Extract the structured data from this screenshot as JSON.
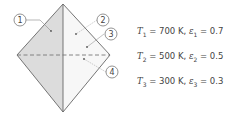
{
  "diagram": {
    "labels": [
      "1",
      "2",
      "3",
      "4"
    ],
    "surfaces": [
      {
        "sym": "T",
        "idx": "1",
        "temp": "= 700 K, ",
        "eps_sym": "ε",
        "eps_idx": "1",
        "eps": " = 0.7"
      },
      {
        "sym": "T",
        "idx": "2",
        "temp": "= 500 K, ",
        "eps_sym": "ε",
        "eps_idx": "2",
        "eps": " = 0.5"
      },
      {
        "sym": "T",
        "idx": "3",
        "temp": "= 300 K, ",
        "eps_sym": "ε",
        "eps_idx": "3",
        "eps": " = 0.3"
      }
    ],
    "colors": {
      "shaded": "#dcdcdc",
      "line": "#666666",
      "dashed": "#777777"
    }
  }
}
